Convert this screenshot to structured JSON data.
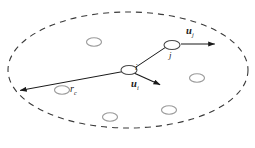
{
  "figure": {
    "name": "network-communication-range-diagram",
    "width": 255,
    "height": 148,
    "background": "#ffffff"
  },
  "colors": {
    "boundary": "#3a3a3a",
    "node_stroke": "#9a9a9a",
    "focus_node_stroke": "#4a4a4a",
    "vector": "#1a1a1a",
    "link": "#1a1a1a",
    "label": "#1a1a1a"
  },
  "labels": {
    "velocity_j": {
      "base": "u",
      "sub": "j"
    },
    "velocity_i": {
      "base": "u",
      "sub": "i"
    },
    "radius": {
      "base": "r",
      "sub": "c"
    },
    "node_i": "i",
    "node_j": "j"
  },
  "chart_data": {
    "type": "scatter",
    "title": "",
    "xlabel": "",
    "ylabel": "",
    "boundary": {
      "shape": "ellipse",
      "center": [
        128,
        70
      ],
      "rx": 120,
      "ry": 58,
      "style": "dashed",
      "dash": "6,5"
    },
    "nodes": [
      {
        "id": "bg1",
        "cx": 94,
        "cy": 42,
        "rx": 7.5,
        "ry": 4.2,
        "role": "neighbor"
      },
      {
        "id": "bg2",
        "cx": 62,
        "cy": 90,
        "rx": 7.5,
        "ry": 4.2,
        "role": "neighbor"
      },
      {
        "id": "bg3",
        "cx": 197,
        "cy": 78,
        "rx": 7.5,
        "ry": 4.2,
        "role": "neighbor"
      },
      {
        "id": "bg4",
        "cx": 169,
        "cy": 110,
        "rx": 7.5,
        "ry": 4.2,
        "role": "neighbor"
      },
      {
        "id": "bg5",
        "cx": 110,
        "cy": 117,
        "rx": 7.5,
        "ry": 4.2,
        "role": "neighbor"
      },
      {
        "id": "i",
        "cx": 129,
        "cy": 70,
        "rx": 8,
        "ry": 4.5,
        "role": "focus"
      },
      {
        "id": "j",
        "cx": 172,
        "cy": 45,
        "rx": 8,
        "ry": 4.5,
        "role": "focus"
      }
    ],
    "vectors": [
      {
        "name": "u_j",
        "from": [
          181,
          44
        ],
        "to": [
          218,
          44
        ]
      },
      {
        "name": "u_i",
        "from": [
          134,
          73
        ],
        "to": [
          163,
          86
        ]
      },
      {
        "name": "r_c",
        "from": [
          126,
          71
        ],
        "to": [
          17,
          91
        ]
      }
    ],
    "links": [
      {
        "from": "i",
        "to": "j",
        "points": [
          [
            136,
            67
          ],
          [
            166,
            47
          ]
        ]
      }
    ]
  }
}
